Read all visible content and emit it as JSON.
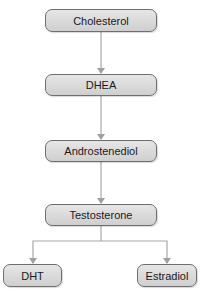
{
  "diagram": {
    "type": "flowchart",
    "nodes": [
      {
        "id": "cholesterol",
        "label": "Cholesterol"
      },
      {
        "id": "dhea",
        "label": "DHEA"
      },
      {
        "id": "androstenediol",
        "label": "Androstenediol"
      },
      {
        "id": "testosterone",
        "label": "Testosterone"
      },
      {
        "id": "dht",
        "label": "DHT"
      },
      {
        "id": "estradiol",
        "label": "Estradiol"
      }
    ],
    "edges": [
      {
        "from": "cholesterol",
        "to": "dhea",
        "direction": "forward"
      },
      {
        "from": "dhea",
        "to": "androstenediol",
        "direction": "forward"
      },
      {
        "from": "androstenediol",
        "to": "testosterone",
        "direction": "bidirectional"
      },
      {
        "from": "testosterone",
        "to": "dht",
        "direction": "forward"
      },
      {
        "from": "testosterone",
        "to": "estradiol",
        "direction": "forward"
      }
    ],
    "colors": {
      "node_fill": "#d9d9d9",
      "node_border": "#6e6e6e",
      "edge": "#a0a0a0"
    }
  }
}
